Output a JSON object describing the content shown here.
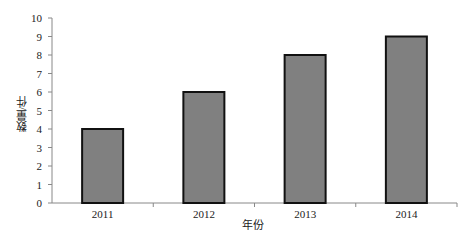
{
  "chart_data": {
    "type": "bar",
    "title": "",
    "categories": [
      "2011",
      "2012",
      "2013",
      "2014"
    ],
    "values": [
      4,
      6,
      8,
      9
    ],
    "xlabel": "年份",
    "ylabel": "数量/件",
    "ylim": [
      0,
      10
    ],
    "yticks": [
      "0",
      "1",
      "2",
      "3",
      "4",
      "5",
      "6",
      "7",
      "8",
      "9",
      "10"
    ],
    "grid": false,
    "legend": null,
    "bar_color": "#808080",
    "bar_edge_color": "#111111"
  }
}
